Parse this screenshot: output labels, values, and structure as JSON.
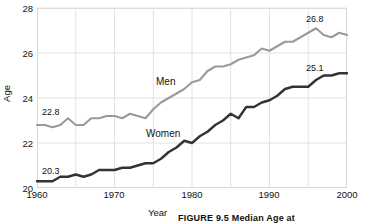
{
  "chart_data": {
    "type": "line",
    "title": "",
    "xlabel": "Year",
    "ylabel": "Age",
    "xlim": [
      1960,
      2000
    ],
    "ylim": [
      20,
      28
    ],
    "grid": true,
    "legend_position": "inline-labels",
    "xticks": [
      "1960",
      "1970",
      "1980",
      "1990",
      "2000"
    ],
    "yticks": [
      "20",
      "22",
      "24",
      "26",
      "28"
    ],
    "x": [
      1960,
      1961,
      1962,
      1963,
      1964,
      1965,
      1966,
      1967,
      1968,
      1969,
      1970,
      1971,
      1972,
      1973,
      1974,
      1975,
      1976,
      1977,
      1978,
      1979,
      1980,
      1981,
      1982,
      1983,
      1984,
      1985,
      1986,
      1987,
      1988,
      1989,
      1990,
      1991,
      1992,
      1993,
      1994,
      1995,
      1996,
      1997,
      1998,
      1999,
      2000
    ],
    "series": [
      {
        "name": "Men",
        "color": "#9a9a9a",
        "start_label": "22.8",
        "end_label": "26.8",
        "values": [
          22.8,
          22.8,
          22.7,
          22.8,
          23.1,
          22.8,
          22.8,
          23.1,
          23.1,
          23.2,
          23.2,
          23.1,
          23.3,
          23.2,
          23.1,
          23.5,
          23.8,
          24.0,
          24.2,
          24.4,
          24.7,
          24.8,
          25.2,
          25.4,
          25.4,
          25.5,
          25.7,
          25.8,
          25.9,
          26.2,
          26.1,
          26.3,
          26.5,
          26.5,
          26.7,
          26.9,
          27.1,
          26.8,
          26.7,
          26.9,
          26.8
        ]
      },
      {
        "name": "Women",
        "color": "#333333",
        "start_label": "20.3",
        "end_label": "25.1",
        "values": [
          20.3,
          20.3,
          20.3,
          20.5,
          20.5,
          20.6,
          20.5,
          20.6,
          20.8,
          20.8,
          20.8,
          20.9,
          20.9,
          21.0,
          21.1,
          21.1,
          21.3,
          21.6,
          21.8,
          22.1,
          22.0,
          22.3,
          22.5,
          22.8,
          23.0,
          23.3,
          23.1,
          23.6,
          23.6,
          23.8,
          23.9,
          24.1,
          24.4,
          24.5,
          24.5,
          24.5,
          24.8,
          25.0,
          25.0,
          25.1,
          25.1
        ]
      }
    ]
  },
  "caption": {
    "text": "FIGURE 9.5  Median Age at"
  }
}
